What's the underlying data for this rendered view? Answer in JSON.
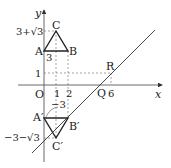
{
  "diagram": {
    "axes": {
      "x_label": "x",
      "y_label": "y",
      "origin_label": "O"
    },
    "x_ticks": [
      "1",
      "2",
      "6"
    ],
    "y_ticks": [
      "1",
      "3+√3",
      "−3−√3"
    ],
    "points": {
      "A": "A",
      "B": "B",
      "C": "C",
      "A_prime": "A′",
      "B_prime": "B′",
      "C_prime": "C′",
      "Q": "Q",
      "R": "R"
    },
    "annotations": {
      "side_AB": "3",
      "arc_label": "−3"
    },
    "colors": {
      "line": "#333333",
      "dashed": "#666666",
      "text": "#222222"
    }
  }
}
